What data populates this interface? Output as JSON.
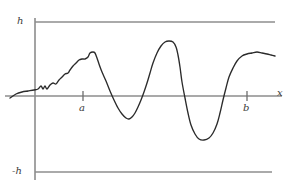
{
  "figure": {
    "background_color": "#ffffff",
    "curve_color": "#2b2b2b",
    "axis_color": "#8c8c8c",
    "labels": {
      "upper_bound": "h",
      "lower_bound": "-h",
      "x_axis": "x",
      "interval_start": "a",
      "interval_end": "b"
    }
  },
  "chart_data": {
    "type": "line",
    "title": "",
    "xlabel": "x",
    "ylabel": "",
    "grid": false,
    "legend": null,
    "axis_origin": {
      "x": 35,
      "y": 96
    },
    "xlim": [
      5,
      282
    ],
    "ylim": [
      -1,
      1
    ],
    "annotations": [
      {
        "text": "h",
        "type": "bound-label",
        "x": 20,
        "y": 22
      },
      {
        "text": "-h",
        "type": "bound-label",
        "x": 16,
        "y": 172
      },
      {
        "text": "a",
        "type": "tick-label",
        "x": 83,
        "y": 108
      },
      {
        "text": "b",
        "type": "tick-label",
        "x": 247,
        "y": 108
      },
      {
        "text": "x",
        "type": "axis-label",
        "x": 279,
        "y": 93
      }
    ],
    "reference_lines": [
      {
        "name": "upper-bound",
        "label": "h",
        "value": 1,
        "y_px": 22,
        "x_from": 35,
        "x_to": 275
      },
      {
        "name": "lower-bound",
        "label": "-h",
        "value": -1,
        "y_px": 172,
        "x_from": 35,
        "x_to": 272
      },
      {
        "name": "x-axis",
        "label": "x",
        "value": 0,
        "y_px": 96,
        "x_from": 5,
        "x_to": 282
      }
    ],
    "tick_marks": [
      {
        "label": "a",
        "x_px": 83,
        "y_px": 96
      },
      {
        "label": "b",
        "x_px": 247,
        "y_px": 96
      }
    ],
    "series": [
      {
        "name": "f(x)",
        "color": "#2b2b2b",
        "points_px": [
          [
            10,
            98
          ],
          [
            16,
            94
          ],
          [
            22,
            92
          ],
          [
            28,
            91
          ],
          [
            34,
            90
          ],
          [
            38,
            89
          ],
          [
            41,
            86
          ],
          [
            43,
            89
          ],
          [
            45,
            86
          ],
          [
            47,
            89
          ],
          [
            50,
            85
          ],
          [
            53,
            83
          ],
          [
            56,
            84
          ],
          [
            59,
            80
          ],
          [
            62,
            77
          ],
          [
            65,
            74
          ],
          [
            68,
            73
          ],
          [
            70,
            70
          ],
          [
            73,
            66
          ],
          [
            76,
            63
          ],
          [
            79,
            60
          ],
          [
            82,
            59
          ],
          [
            85,
            59
          ],
          [
            88,
            57
          ],
          [
            90,
            53
          ],
          [
            93,
            52
          ],
          [
            95,
            53
          ],
          [
            97,
            58
          ],
          [
            99,
            64
          ],
          [
            102,
            72
          ],
          [
            106,
            81
          ],
          [
            110,
            91
          ],
          [
            114,
            100
          ],
          [
            118,
            108
          ],
          [
            122,
            114
          ],
          [
            126,
            118
          ],
          [
            129,
            119
          ],
          [
            132,
            117
          ],
          [
            135,
            113
          ],
          [
            138,
            107
          ],
          [
            141,
            100
          ],
          [
            144,
            92
          ],
          [
            147,
            83
          ],
          [
            150,
            73
          ],
          [
            153,
            63
          ],
          [
            157,
            53
          ],
          [
            161,
            46
          ],
          [
            165,
            42
          ],
          [
            169,
            41
          ],
          [
            173,
            42
          ],
          [
            176,
            47
          ],
          [
            178,
            55
          ],
          [
            180,
            67
          ],
          [
            182,
            82
          ],
          [
            185,
            98
          ],
          [
            188,
            113
          ],
          [
            191,
            125
          ],
          [
            195,
            134
          ],
          [
            199,
            139
          ],
          [
            204,
            140
          ],
          [
            209,
            138
          ],
          [
            213,
            133
          ],
          [
            217,
            124
          ],
          [
            220,
            113
          ],
          [
            223,
            100
          ],
          [
            226,
            88
          ],
          [
            229,
            77
          ],
          [
            233,
            68
          ],
          [
            237,
            61
          ],
          [
            242,
            56
          ],
          [
            247,
            54
          ],
          [
            252,
            53
          ],
          [
            257,
            52
          ],
          [
            262,
            53
          ],
          [
            267,
            54
          ],
          [
            271,
            55
          ],
          [
            275,
            56
          ]
        ],
        "description": "irregular wiggly rise, dip below axis, tall narrow peak, deep valley, then final rise"
      }
    ]
  }
}
